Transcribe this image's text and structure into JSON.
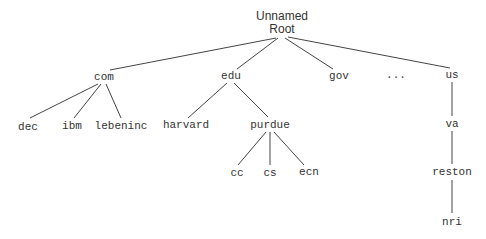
{
  "diagram": {
    "type": "tree",
    "line_color": "#444444",
    "nodes": {
      "root": {
        "label_line1": "Unnamed",
        "label_line2": "Root",
        "x": 282,
        "y": 23
      },
      "com": {
        "label": "com",
        "x": 104,
        "y": 77
      },
      "edu": {
        "label": "edu",
        "x": 231,
        "y": 76
      },
      "gov": {
        "label": "gov",
        "x": 339,
        "y": 76
      },
      "ellipsis": {
        "label": "...",
        "x": 396,
        "y": 75
      },
      "us": {
        "label": "us",
        "x": 452,
        "y": 75
      },
      "dec": {
        "label": "dec",
        "x": 28,
        "y": 127
      },
      "ibm": {
        "label": "ibm",
        "x": 72,
        "y": 126
      },
      "lebeninc": {
        "label": "lebeninc",
        "x": 121,
        "y": 126
      },
      "harvard": {
        "label": "harvard",
        "x": 186,
        "y": 125
      },
      "purdue": {
        "label": "purdue",
        "x": 270,
        "y": 125
      },
      "va": {
        "label": "va",
        "x": 452,
        "y": 124
      },
      "cc": {
        "label": "cc",
        "x": 237,
        "y": 173
      },
      "cs": {
        "label": "cs",
        "x": 270,
        "y": 173
      },
      "ecn": {
        "label": "ecn",
        "x": 309,
        "y": 172
      },
      "reston": {
        "label": "reston",
        "x": 452,
        "y": 172
      },
      "nri": {
        "label": "nri",
        "x": 452,
        "y": 222
      }
    },
    "edges": [
      {
        "from": "root",
        "to": "com",
        "x1": 276,
        "y1": 38,
        "x2": 110,
        "y2": 70
      },
      {
        "from": "root",
        "to": "edu",
        "x1": 278,
        "y1": 38,
        "x2": 237,
        "y2": 69
      },
      {
        "from": "root",
        "to": "gov",
        "x1": 285,
        "y1": 38,
        "x2": 333,
        "y2": 69
      },
      {
        "from": "root",
        "to": "us",
        "x1": 288,
        "y1": 37,
        "x2": 450,
        "y2": 68
      },
      {
        "from": "com",
        "to": "dec",
        "x1": 98,
        "y1": 84,
        "x2": 30,
        "y2": 118
      },
      {
        "from": "com",
        "to": "ibm",
        "x1": 101,
        "y1": 84,
        "x2": 74,
        "y2": 118
      },
      {
        "from": "com",
        "to": "lebeninc",
        "x1": 106,
        "y1": 84,
        "x2": 121,
        "y2": 118
      },
      {
        "from": "edu",
        "to": "harvard",
        "x1": 227,
        "y1": 83,
        "x2": 188,
        "y2": 118
      },
      {
        "from": "edu",
        "to": "purdue",
        "x1": 234,
        "y1": 83,
        "x2": 268,
        "y2": 117
      },
      {
        "from": "purdue",
        "to": "cc",
        "x1": 266,
        "y1": 132,
        "x2": 238,
        "y2": 165
      },
      {
        "from": "purdue",
        "to": "cs",
        "x1": 270,
        "y1": 132,
        "x2": 270,
        "y2": 165
      },
      {
        "from": "purdue",
        "to": "ecn",
        "x1": 274,
        "y1": 132,
        "x2": 304,
        "y2": 165
      },
      {
        "from": "us",
        "to": "va",
        "x1": 452,
        "y1": 82,
        "x2": 452,
        "y2": 116
      },
      {
        "from": "va",
        "to": "reston",
        "x1": 452,
        "y1": 131,
        "x2": 452,
        "y2": 164
      },
      {
        "from": "reston",
        "to": "nri",
        "x1": 452,
        "y1": 180,
        "x2": 452,
        "y2": 213
      }
    ]
  }
}
